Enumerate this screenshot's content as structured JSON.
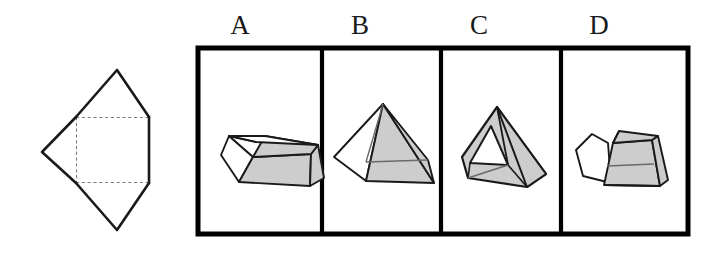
{
  "figure": {
    "type": "spatial-reasoning-net-folding-question",
    "prompt_net": {
      "name": "unfolded-net",
      "description": "Net of a solid: one square face with two large triangular flaps above and below and one triangular flap to the left",
      "solid_line_color": "#1a1a1a",
      "dashed_line_color": "#555555",
      "fill_color": "#ffffff"
    },
    "answer_frame": {
      "border_color": "#000000",
      "fill_color": "#ffffff",
      "panel_count": 4
    },
    "shade_color": "#cdcdcd",
    "white_face_color": "#ffffff",
    "outline_color": "#1a1a1a"
  },
  "options": [
    {
      "label": "A",
      "shape_name": "truncated-pyramid-frustum",
      "description": "Square frustum with flat top, left face white, front and right faces shaded"
    },
    {
      "label": "B",
      "shape_name": "square-pyramid",
      "description": "Complete square pyramid with pointed apex, left face white, front and right faces shaded"
    },
    {
      "label": "C",
      "shape_name": "pyramid-with-triangular-hole",
      "description": "Tilted pyramid seen from above with a white triangular opening in the left face"
    },
    {
      "label": "D",
      "shape_name": "split-frustum",
      "description": "Frustum with a notched / separated left flap, front and right faces shaded"
    }
  ],
  "layout": {
    "frame_left": 198,
    "frame_top": 48,
    "frame_right": 688,
    "frame_bottom": 234,
    "dividers": [
      322,
      441,
      561
    ],
    "label_y": 12
  }
}
